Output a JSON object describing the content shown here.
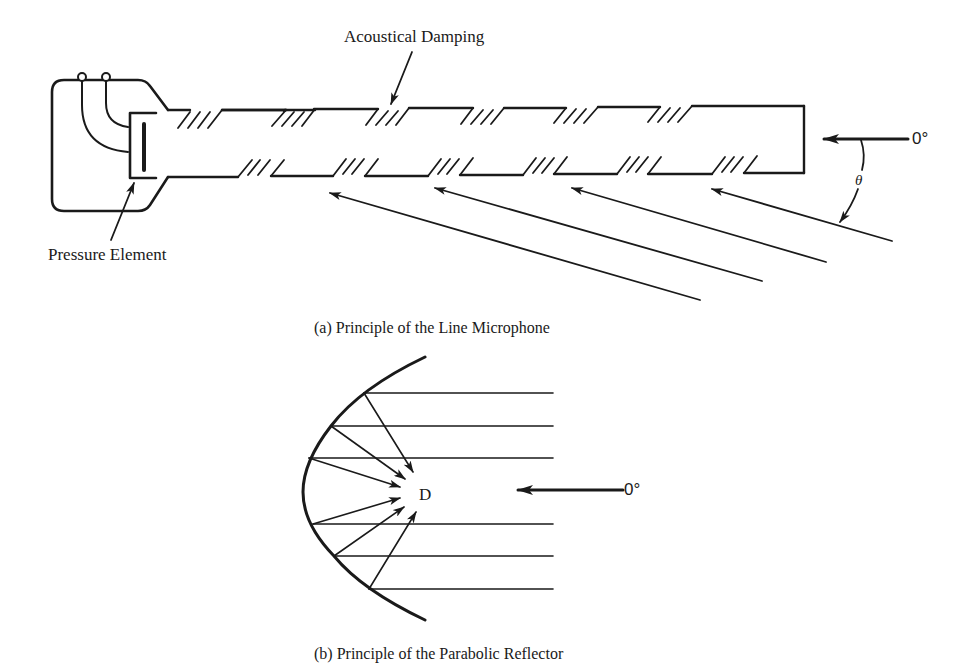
{
  "figure_a": {
    "caption": "(a)  Principle of the Line Microphone",
    "labels": {
      "acoustical_damping": "Acoustical Damping",
      "pressure_element": "Pressure Element",
      "zero_degree": "0°",
      "theta": "θ"
    },
    "incident_arrow_count": 4
  },
  "figure_b": {
    "caption": "(b)  Principle of the Parabolic Reflector",
    "labels": {
      "focus": "D",
      "zero_degree": "0°"
    },
    "parallel_ray_count": 6
  },
  "colors": {
    "ink": "#1a1a1a",
    "background": "#ffffff"
  }
}
